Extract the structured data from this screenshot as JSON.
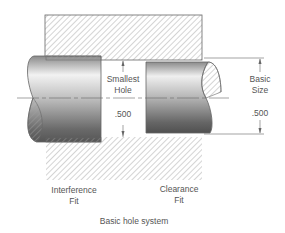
{
  "diagram": {
    "title": "Basic hole system",
    "labels": {
      "smallest_hole_line1": "Smallest",
      "smallest_hole_line2": "Hole",
      "smallest_hole_value": ".500",
      "basic_size_line1": "Basic",
      "basic_size_line2": "Size",
      "basic_size_value": ".500",
      "interference_line1": "Interference",
      "interference_line2": "Fit",
      "clearance_line1": "Clearance",
      "clearance_line2": "Fit"
    },
    "colors": {
      "line": "#666666",
      "hatch": "#9a9a9a",
      "text": "#555555"
    }
  }
}
